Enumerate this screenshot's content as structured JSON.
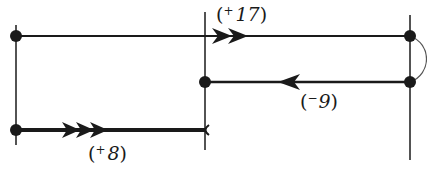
{
  "diagram": {
    "type": "number-line-walk",
    "stroke_color": "#1a1a1a",
    "background": "#ffffff",
    "nodes": [
      {
        "id": "top-left",
        "x": 16,
        "y": 36
      },
      {
        "id": "bottom-left",
        "x": 16,
        "y": 130
      },
      {
        "id": "middle-center",
        "x": 205,
        "y": 82
      },
      {
        "id": "top-right",
        "x": 410,
        "y": 36
      },
      {
        "id": "middle-right",
        "x": 410,
        "y": 82
      }
    ],
    "verticals": [
      {
        "id": "left",
        "x": 16,
        "y1": 25,
        "y2": 145
      },
      {
        "id": "center",
        "x": 205,
        "y1": 12,
        "y2": 150
      },
      {
        "id": "right",
        "x": 410,
        "y1": 15,
        "y2": 160
      }
    ],
    "segments": [
      {
        "id": "plus-17",
        "label_sign": "+",
        "label_value": "17",
        "open": "(",
        "close": ")",
        "direction": "right",
        "arrowheads": 2
      },
      {
        "id": "minus-9",
        "label_sign": "−",
        "label_value": "9",
        "open": "(",
        "close": ")",
        "direction": "left",
        "arrowheads": 1
      },
      {
        "id": "plus-8",
        "label_sign": "+",
        "label_value": "8",
        "open": "(",
        "close": ")",
        "direction": "right",
        "arrowheads": 3
      }
    ]
  }
}
